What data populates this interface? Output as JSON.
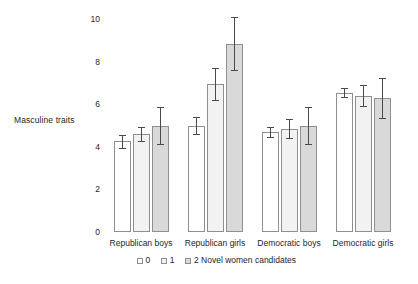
{
  "chart_data": {
    "type": "bar",
    "title": "",
    "subtitle": "",
    "xlabel": "",
    "ylabel": "Masculine traits",
    "ylim": [
      0,
      10
    ],
    "yticks": [
      0,
      2,
      4,
      6,
      8,
      10
    ],
    "ytick_labels": [
      "0",
      "2",
      "4",
      "6",
      "8",
      "10"
    ],
    "grid": false,
    "legend_position": "bottom",
    "legend_title": "Novel women candidates",
    "categories": [
      "Republican boys",
      "Republican girls",
      "Democratic boys",
      "Democratic girls"
    ],
    "series": [
      {
        "name": "0",
        "color": "#ffffff",
        "values": [
          4.25,
          5.0,
          4.7,
          6.55
        ],
        "errors": [
          0.3,
          0.4,
          0.25,
          0.2
        ]
      },
      {
        "name": "1",
        "color": "#f2f2f2",
        "values": [
          4.6,
          6.95,
          4.85,
          6.4
        ],
        "errors": [
          0.35,
          0.75,
          0.45,
          0.5
        ]
      },
      {
        "name": "2",
        "color": "#d9d9d9",
        "values": [
          5.0,
          8.85,
          5.0,
          6.3
        ],
        "errors": [
          0.85,
          1.25,
          0.85,
          0.95
        ]
      }
    ]
  },
  "legend": {
    "entries": [
      {
        "label": "0"
      },
      {
        "label": "1"
      },
      {
        "label": "2 Novel women candidates"
      }
    ]
  },
  "axis": {
    "y_title": "Masculine traits"
  }
}
